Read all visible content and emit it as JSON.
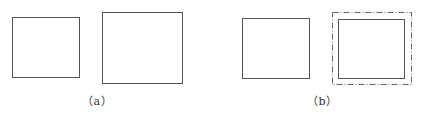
{
  "panels": [
    {
      "label": "（a）",
      "shapes": [
        {
          "type": "rect",
          "style": "solid",
          "x": 12,
          "y": 17,
          "w": 67,
          "h": 60
        },
        {
          "type": "rect",
          "style": "solid",
          "x": 102,
          "y": 12,
          "w": 80,
          "h": 71
        }
      ]
    },
    {
      "label": "（b）",
      "shapes": [
        {
          "type": "rect",
          "style": "solid",
          "x": 242,
          "y": 18,
          "w": 67,
          "h": 60
        },
        {
          "type": "rect",
          "style": "dash-dot",
          "x": 332,
          "y": 12,
          "w": 79,
          "h": 72
        },
        {
          "type": "rect",
          "style": "solid",
          "x": 338,
          "y": 19,
          "w": 66,
          "h": 59
        }
      ]
    }
  ],
  "colors": {
    "stroke": "#555555",
    "background": "#ffffff"
  }
}
